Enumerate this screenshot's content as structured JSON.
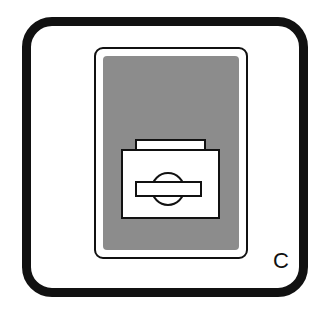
{
  "figure": {
    "label": "C",
    "icon": "drawer-icon",
    "colors": {
      "stroke": "#111111",
      "background": "#ffffff",
      "panel_fill": "#c8c8c8"
    }
  }
}
